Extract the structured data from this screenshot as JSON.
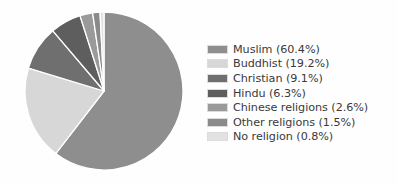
{
  "chart_data": {
    "type": "pie",
    "title": "",
    "categories": [
      "Muslim",
      "Buddhist",
      "Christian",
      "Hindu",
      "Chinese religions",
      "Other religions",
      "No religion"
    ],
    "values": [
      60.4,
      19.2,
      9.1,
      6.3,
      2.6,
      1.5,
      0.8
    ],
    "value_unit": "%",
    "legend_position": "right",
    "grid": false,
    "start_angle_deg": 0,
    "direction": "clockwise",
    "slice_colors": [
      "#8e8e8e",
      "#d7d7d7",
      "#6f6f6f",
      "#5e5e5e",
      "#9a9a9a",
      "#8a8a8a",
      "#e2e2e2"
    ],
    "separator_color": "#ffffff",
    "labels": [
      "Muslim (60.4%)",
      "Buddhist (19.2%)",
      "Christian (9.1%)",
      "Hindu (6.3%)",
      "Chinese religions (2.6%)",
      "Other religions (1.5%)",
      "No religion (0.8%)"
    ]
  },
  "legend": {
    "items": [
      {
        "label": "Muslim (60.4%)",
        "color": "#8e8e8e",
        "name": "muslim"
      },
      {
        "label": "Buddhist (19.2%)",
        "color": "#d7d7d7",
        "name": "buddhist"
      },
      {
        "label": "Christian (9.1%)",
        "color": "#6f6f6f",
        "name": "christian"
      },
      {
        "label": "Hindu (6.3%)",
        "color": "#5e5e5e",
        "name": "hindu"
      },
      {
        "label": "Chinese religions (2.6%)",
        "color": "#9a9a9a",
        "name": "chinese-religions"
      },
      {
        "label": "Other religions (1.5%)",
        "color": "#8a8a8a",
        "name": "other-religions"
      },
      {
        "label": "No religion (0.8%)",
        "color": "#e2e2e2",
        "name": "no-religion"
      }
    ]
  }
}
